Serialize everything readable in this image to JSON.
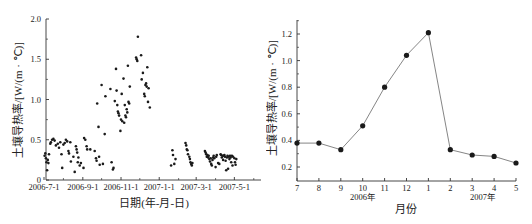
{
  "chart_data": [
    {
      "type": "scatter",
      "title": "",
      "xlabel": "日期(年-月-日)",
      "ylabel": "土壤导热率/[W/(m · ℃)]",
      "ylim": [
        0,
        2.0
      ],
      "yticks": [
        0,
        0.5,
        1.0,
        1.5,
        2.0
      ],
      "ytick_labels": [
        "0",
        "0.5",
        "1.0",
        "1.5",
        "2.0"
      ],
      "xtick_labels": [
        "2006-7-1",
        "2006-9-1",
        "2006-11-1",
        "2007-1-1",
        "2007-3-1",
        "2007-5-1"
      ],
      "grid": false,
      "legend": null,
      "points": [
        [
          "2006-7-2",
          0.3
        ],
        [
          "2006-7-3",
          0.33
        ],
        [
          "2006-7-4",
          0.27
        ],
        [
          "2006-7-5",
          0.22
        ],
        [
          "2006-7-6",
          0.12
        ],
        [
          "2006-7-7",
          0.25
        ],
        [
          "2006-7-8",
          0.21
        ],
        [
          "2006-7-9",
          0.32
        ],
        [
          "2006-7-11",
          0.45
        ],
        [
          "2006-7-12",
          0.47
        ],
        [
          "2006-7-14",
          0.5
        ],
        [
          "2006-7-16",
          0.51
        ],
        [
          "2006-7-18",
          0.49
        ],
        [
          "2006-7-20",
          0.43
        ],
        [
          "2006-7-23",
          0.45
        ],
        [
          "2006-7-25",
          0.4
        ],
        [
          "2006-7-27",
          0.47
        ],
        [
          "2006-7-29",
          0.32
        ],
        [
          "2006-7-30",
          0.15
        ],
        [
          "2006-8-1",
          0.44
        ],
        [
          "2006-8-3",
          0.46
        ],
        [
          "2006-8-5",
          0.5
        ],
        [
          "2006-8-7",
          0.48
        ],
        [
          "2006-8-9",
          0.36
        ],
        [
          "2006-8-10",
          0.33
        ],
        [
          "2006-8-12",
          0.47
        ],
        [
          "2006-8-13",
          0.23
        ],
        [
          "2006-8-17",
          0.29
        ],
        [
          "2006-8-19",
          0.1
        ],
        [
          "2006-8-21",
          0.42
        ],
        [
          "2006-8-22",
          0.38
        ],
        [
          "2006-8-23",
          0.34
        ],
        [
          "2006-8-24",
          0.22
        ],
        [
          "2006-8-25",
          0.28
        ],
        [
          "2006-8-27",
          0.18
        ],
        [
          "2006-8-29",
          0.21
        ],
        [
          "2006-9-2",
          0.15
        ],
        [
          "2006-9-3",
          0.52
        ],
        [
          "2006-9-5",
          0.5
        ],
        [
          "2006-9-7",
          0.42
        ],
        [
          "2006-9-8",
          0.38
        ],
        [
          "2006-9-13",
          0.38
        ],
        [
          "2006-9-20",
          0.36
        ],
        [
          "2006-9-22",
          0.27
        ],
        [
          "2006-9-23",
          0.24
        ],
        [
          "2006-9-24",
          0.95
        ],
        [
          "2006-9-26",
          0.66
        ],
        [
          "2006-9-27",
          0.29
        ],
        [
          "2006-9-28",
          0.19
        ],
        [
          "2006-10-1",
          1.18
        ],
        [
          "2006-10-3",
          0.2
        ],
        [
          "2006-10-6",
          0.57
        ],
        [
          "2006-10-7",
          1.04
        ],
        [
          "2006-10-15",
          1.13
        ],
        [
          "2006-10-17",
          0.22
        ],
        [
          "2006-10-19",
          0.13
        ],
        [
          "2006-10-20",
          0.15
        ],
        [
          "2006-10-22",
          0.98
        ],
        [
          "2006-10-24",
          1.38
        ],
        [
          "2006-10-25",
          1.11
        ],
        [
          "2006-10-26",
          0.93
        ],
        [
          "2006-10-27",
          0.85
        ],
        [
          "2006-10-28",
          0.83
        ],
        [
          "2006-10-29",
          0.8
        ],
        [
          "2006-10-31",
          0.61
        ],
        [
          "2006-11-1",
          0.75
        ],
        [
          "2006-11-2",
          1.07
        ],
        [
          "2006-11-3",
          0.73
        ],
        [
          "2006-11-5",
          1.26
        ],
        [
          "2006-11-6",
          0.71
        ],
        [
          "2006-11-7",
          0.93
        ],
        [
          "2006-11-8",
          0.8
        ],
        [
          "2006-11-9",
          0.78
        ],
        [
          "2006-11-10",
          0.88
        ],
        [
          "2006-11-11",
          0.84
        ],
        [
          "2006-11-12",
          1.42
        ],
        [
          "2006-11-13",
          0.97
        ],
        [
          "2006-11-14",
          0.95
        ],
        [
          "2006-11-15",
          1.16
        ],
        [
          "2006-11-25",
          1.52
        ],
        [
          "2006-11-26",
          1.5
        ],
        [
          "2006-11-27",
          1.48
        ],
        [
          "2006-11-28",
          1.78
        ],
        [
          "2006-12-3",
          1.55
        ],
        [
          "2006-12-4",
          1.25
        ],
        [
          "2006-12-6",
          1.33
        ],
        [
          "2006-12-8",
          1.07
        ],
        [
          "2006-12-9",
          1.04
        ],
        [
          "2006-12-10",
          1.18
        ],
        [
          "2006-12-11",
          1.2
        ],
        [
          "2006-12-12",
          1.16
        ],
        [
          "2006-12-13",
          1.4
        ],
        [
          "2006-12-14",
          0.97
        ],
        [
          "2006-12-15",
          1.14
        ],
        [
          "2006-12-17",
          0.9
        ],
        [
          "2007-1-20",
          0.18
        ],
        [
          "2007-1-22",
          0.37
        ],
        [
          "2007-1-23",
          0.31
        ],
        [
          "2007-1-25",
          0.2
        ],
        [
          "2007-1-27",
          0.26
        ],
        [
          "2007-2-12",
          0.46
        ],
        [
          "2007-2-13",
          0.43
        ],
        [
          "2007-2-14",
          0.38
        ],
        [
          "2007-2-15",
          0.37
        ],
        [
          "2007-2-16",
          0.32
        ],
        [
          "2007-2-18",
          0.29
        ],
        [
          "2007-2-19",
          0.26
        ],
        [
          "2007-2-20",
          0.22
        ],
        [
          "2007-2-21",
          0.2
        ],
        [
          "2007-2-22",
          0.18
        ],
        [
          "2007-2-23",
          0.21
        ],
        [
          "2007-3-15",
          0.36
        ],
        [
          "2007-3-16",
          0.34
        ],
        [
          "2007-3-17",
          0.32
        ],
        [
          "2007-3-18",
          0.29
        ],
        [
          "2007-3-19",
          0.31
        ],
        [
          "2007-3-20",
          0.28
        ],
        [
          "2007-3-21",
          0.3
        ],
        [
          "2007-3-22",
          0.26
        ],
        [
          "2007-3-23",
          0.23
        ],
        [
          "2007-3-24",
          0.27
        ],
        [
          "2007-3-25",
          0.2
        ],
        [
          "2007-3-26",
          0.18
        ],
        [
          "2007-3-27",
          0.25
        ],
        [
          "2007-3-28",
          0.28
        ],
        [
          "2007-3-29",
          0.3
        ],
        [
          "2007-3-30",
          0.27
        ],
        [
          "2007-4-1",
          0.16
        ],
        [
          "2007-4-2",
          0.29
        ],
        [
          "2007-4-3",
          0.31
        ],
        [
          "2007-4-5",
          0.21
        ],
        [
          "2007-4-7",
          0.2
        ],
        [
          "2007-4-9",
          0.32
        ],
        [
          "2007-4-10",
          0.31
        ],
        [
          "2007-4-11",
          0.28
        ],
        [
          "2007-4-12",
          0.3
        ],
        [
          "2007-4-13",
          0.25
        ],
        [
          "2007-4-14",
          0.3
        ],
        [
          "2007-4-15",
          0.31
        ],
        [
          "2007-4-16",
          0.29
        ],
        [
          "2007-4-17",
          0.24
        ],
        [
          "2007-4-18",
          0.12
        ],
        [
          "2007-4-19",
          0.28
        ],
        [
          "2007-4-20",
          0.3
        ],
        [
          "2007-4-21",
          0.14
        ],
        [
          "2007-4-22",
          0.29
        ],
        [
          "2007-4-23",
          0.26
        ],
        [
          "2007-4-24",
          0.3
        ],
        [
          "2007-4-25",
          0.28
        ],
        [
          "2007-4-26",
          0.22
        ],
        [
          "2007-4-27",
          0.3
        ],
        [
          "2007-4-28",
          0.18
        ],
        [
          "2007-4-29",
          0.29
        ],
        [
          "2007-5-1",
          0.27
        ],
        [
          "2007-5-2",
          0.22
        ],
        [
          "2007-5-3",
          0.19
        ],
        [
          "2007-5-4",
          0.26
        ]
      ]
    },
    {
      "type": "line",
      "title": "",
      "xlabel": "月份",
      "ylabel": "土壤导热率/[W/(m · ℃)]",
      "ylim": [
        0.1,
        1.3
      ],
      "yticks": [
        0.2,
        0.4,
        0.6,
        0.8,
        1.0,
        1.2
      ],
      "ytick_labels": [
        "0.2",
        "0.4",
        "0.6",
        "0.8",
        "1.0",
        "1.2"
      ],
      "categories": [
        "7",
        "8",
        "9",
        "10",
        "11",
        "12",
        "1",
        "2",
        "3",
        "4",
        "5"
      ],
      "year_labels": [
        {
          "label": "2006年",
          "under": "10"
        },
        {
          "label": "2007年",
          "under": "3"
        }
      ],
      "grid": false,
      "legend": null,
      "series": [
        {
          "name": "月均土壤导热率",
          "values": [
            0.38,
            0.38,
            0.33,
            0.51,
            0.8,
            1.04,
            1.21,
            0.33,
            0.29,
            0.28,
            0.23
          ]
        }
      ]
    }
  ],
  "left": {
    "ylabel": "土壤导热率/[W/(m · ℃)]",
    "xlabel": "日期(年-月-日)",
    "yticks": [
      "0",
      "0.5",
      "1.0",
      "1.5",
      "2.0"
    ],
    "xticks": [
      "2006-7-1",
      "2006-9-1",
      "2006-11-1",
      "2007-1-1",
      "2007-3-1",
      "2007-5-1"
    ]
  },
  "right": {
    "ylabel": "土壤导热率/[W/(m · ℃)]",
    "xlabel": "月份",
    "yticks": [
      "0.2",
      "0.4",
      "0.6",
      "0.8",
      "1.0",
      "1.2"
    ],
    "xticks": [
      "7",
      "8",
      "9",
      "10",
      "11",
      "12",
      "1",
      "2",
      "3",
      "4",
      "5"
    ],
    "year_2006": "2006年",
    "year_2007": "2007年"
  },
  "colors": {
    "marker": "#1a1a1a",
    "line": "#777777",
    "axis": "#333333",
    "text": "#222222"
  }
}
